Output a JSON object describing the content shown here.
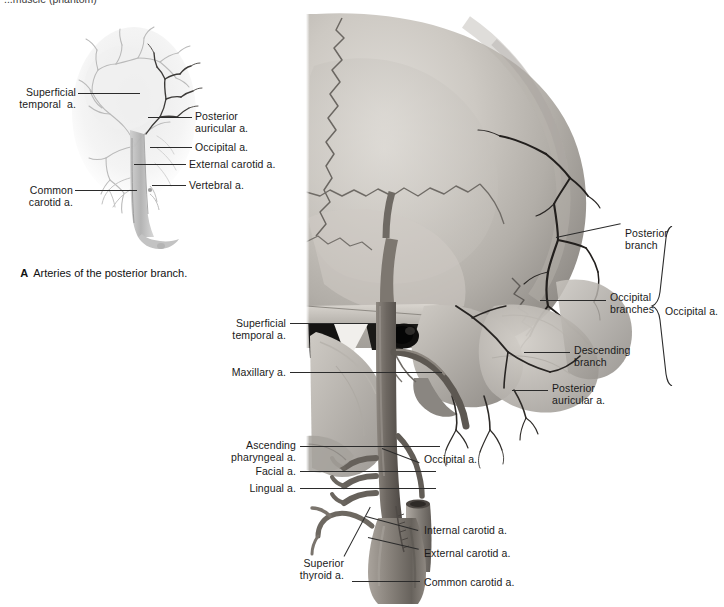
{
  "figure": {
    "top_cut_text": "...muscle (phantom)",
    "caption_letter": "A",
    "caption_text": "Arteries of the posterior branch."
  },
  "figure_a": {
    "name": "arteries-of-posterior-branch-angiogram",
    "labels": [
      {
        "id": "superficial-temporal",
        "text": "Superficial\ntemporal  a.",
        "align": "right",
        "x": 8,
        "y": 86
      },
      {
        "id": "common-carotid",
        "text": "Common\ncarotid a.",
        "align": "right",
        "x": 20,
        "y": 184
      },
      {
        "id": "posterior-auricular",
        "text": "Posterior\nauricular a.",
        "align": "left",
        "x": 196,
        "y": 110
      },
      {
        "id": "occipital",
        "text": "Occipital a.",
        "align": "left",
        "x": 196,
        "y": 142
      },
      {
        "id": "external-carotid",
        "text": "External carotid a.",
        "align": "left",
        "x": 189,
        "y": 159
      },
      {
        "id": "vertebral",
        "text": "Vertebral a.",
        "align": "left",
        "x": 189,
        "y": 180
      }
    ]
  },
  "figure_b": {
    "name": "lateral-skull-occipital-artery-dissection",
    "labels_left": [
      {
        "id": "superficial-temporal",
        "text": "Superficial\ntemporal a.",
        "x": 228,
        "y": 318
      },
      {
        "id": "maxillary",
        "text": "Maxillary a.",
        "x": 228,
        "y": 367
      },
      {
        "id": "ascending-pharyngeal",
        "text": "Ascending\npharyngeal a.",
        "x": 228,
        "y": 440
      },
      {
        "id": "facial",
        "text": "Facial a.",
        "x": 228,
        "y": 466
      },
      {
        "id": "lingual",
        "text": "Lingual a.",
        "x": 228,
        "y": 483
      },
      {
        "id": "superior-thyroid",
        "text": "Superior\nthyroid a.",
        "x": 316,
        "y": 558
      }
    ],
    "labels_right": [
      {
        "id": "posterior-branch",
        "text": "Posterior\nbranch",
        "x": 626,
        "y": 228
      },
      {
        "id": "occipital-branches",
        "text": "Occipital\nbranches",
        "x": 611,
        "y": 292
      },
      {
        "id": "occipital-artery",
        "text": "Occipital a.",
        "x": 665,
        "y": 305
      },
      {
        "id": "descending-branch",
        "text": "Descending\nbranch",
        "x": 576,
        "y": 345
      },
      {
        "id": "posterior-auricular",
        "text": "Posterior\nauricular a.",
        "x": 553,
        "y": 383
      },
      {
        "id": "occipital-lower",
        "text": "Occipital a.",
        "x": 424,
        "y": 454
      },
      {
        "id": "internal-carotid",
        "text": "Internal carotid a.",
        "x": 424,
        "y": 525
      },
      {
        "id": "external-carotid",
        "text": "External carotid a.",
        "x": 424,
        "y": 548
      },
      {
        "id": "common-carotid",
        "text": "Common carotid a.",
        "x": 424,
        "y": 577
      }
    ]
  },
  "colors": {
    "leader_line": "#2b2b2b",
    "text": "#1a1a1a",
    "bone_light": "#d8d5d0",
    "bone_mid": "#b6b2ac",
    "bone_dark": "#8e8a85",
    "vessel": "#6e6862",
    "vessel_dark": "#2f2c29",
    "background": "#ffffff"
  }
}
